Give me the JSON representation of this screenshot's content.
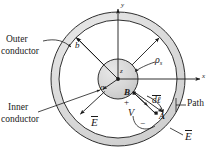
{
  "figure": {
    "type": "coaxial-cable-cross-section",
    "colors": {
      "conductor_fill": "#d3d3d3",
      "conductor_fill_light": "#e2e2e2",
      "stroke": "#1a1a1a",
      "background": "#ffffff"
    }
  },
  "labels": {
    "outer_conductor_line1": "Outer",
    "outer_conductor_line2": "conductor",
    "inner_conductor_line1": "Inner",
    "inner_conductor_line2": "conductor",
    "path": "Path"
  },
  "axes": {
    "y_label": "y",
    "x_label": "x",
    "z_label": "z"
  },
  "symbols": {
    "inner_radius": "a",
    "outer_radius": "b",
    "surface_charge": "ρ",
    "surface_charge_sub": "s",
    "efield": "E",
    "efield_2": "E",
    "voltage": "V",
    "plus": "+",
    "minus": "−",
    "point_a": "A",
    "point_b": "B",
    "dl_d": "d",
    "dl_l": "ℓ"
  },
  "geometry": {
    "center_x": 118,
    "center_y": 79,
    "inner_conductor_radius": 20,
    "outer_conductor_inner_radius": 59,
    "outer_conductor_outer_radius": 67
  }
}
